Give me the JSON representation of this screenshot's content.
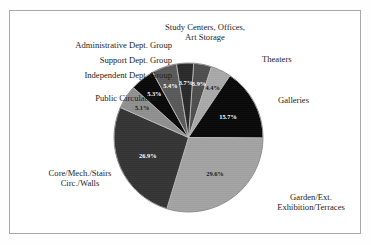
{
  "chart_data": {
    "type": "pie",
    "title": "",
    "legend_position": "callout-labels",
    "grid": false,
    "units": "percent",
    "start_angle_deg": -86,
    "direction": "clockwise",
    "categories": [
      "Study Centers, Offices, Art Storage",
      "Theaters",
      "Galleries",
      "Garden/Ext. Exhibition/Terraces",
      "Core/Mech./Stairs Circ./Walls",
      "Public Circulation",
      "Independent Dept. Group",
      "Support Dept. Group",
      "Administrative Dept. Group"
    ],
    "values": [
      3.9,
      4.4,
      15.7,
      29.6,
      26.9,
      5.1,
      5.3,
      5.4,
      3.7
    ],
    "value_labels": [
      "3.9%",
      "4.4%",
      "15.7%",
      "29.6%",
      "26.9%",
      "5.1%",
      "5.3%",
      "5.4%",
      "3.7%"
    ],
    "colors": [
      "#6e6e6e",
      "#ededed",
      "#0d0d0d",
      "#e4e4e4",
      "#4a4a4a",
      "#c9c9c9",
      "#0d0d0d",
      "#7d7d7d",
      "#3a3a3a"
    ],
    "label_text_colors": [
      "#ffffff",
      "#1a1a1a",
      "#ffffff",
      "#1a1a1a",
      "#ffffff",
      "#1a1a1a",
      "#ffffff",
      "#ffffff",
      "#ffffff"
    ]
  },
  "labels": {
    "study_centers": "Study Centers, Offices,\nArt Storage",
    "administrative": "Administrative Dept. Group",
    "support": "Support Dept. Group",
    "independent": "Independent Dept. Group",
    "public_circulation": "Public Circulation",
    "theaters": "Theaters",
    "galleries": "Galleries",
    "garden": "Garden/Ext.\nExhibition/Terraces",
    "core_mech": "Core/Mech./Stairs\nCirc./Walls"
  },
  "percent_labels": {
    "study_centers": "3.9%",
    "theaters": "4.4%",
    "galleries": "15.7%",
    "garden": "29.6%",
    "core_mech": "26.9%",
    "public_circulation": "5.1%",
    "independent": "5.3%",
    "support": "5.4%",
    "administrative": "3.7%"
  }
}
